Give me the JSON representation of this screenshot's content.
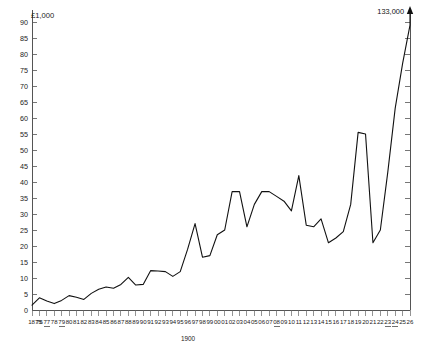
{
  "chart_data": {
    "type": "line",
    "title": "",
    "subtitle": "",
    "xlabel": "",
    "ylabel": "£1,000",
    "unit_label": "£1,000",
    "era_label": "1900",
    "ylim": [
      0,
      90
    ],
    "ytick_step": 5,
    "grid": false,
    "legend": null,
    "x": [
      1875,
      1876,
      1877,
      1878,
      1879,
      1880,
      1881,
      1882,
      1883,
      1884,
      1885,
      1886,
      1887,
      1888,
      1889,
      1890,
      1891,
      1892,
      1893,
      1894,
      1895,
      1896,
      1897,
      1898,
      1899,
      1900,
      1901,
      1902,
      1903,
      1904,
      1905,
      1906,
      1907,
      1908,
      1909,
      1910,
      1911,
      1912,
      1913,
      1914,
      1915,
      1916,
      1917,
      1918,
      1919,
      1920,
      1921,
      1922,
      1923,
      1924,
      1925,
      1926
    ],
    "xtick_labels": [
      "1875",
      "76",
      "77",
      "78",
      "79",
      "80",
      "81",
      "82",
      "83",
      "84",
      "85",
      "86",
      "87",
      "88",
      "89",
      "90",
      "91",
      "92",
      "93",
      "94",
      "95",
      "96",
      "97",
      "98",
      "99",
      "00",
      "01",
      "02",
      "03",
      "04",
      "05",
      "06",
      "07",
      "08",
      "09",
      "10",
      "11",
      "12",
      "13",
      "14",
      "15",
      "16",
      "17",
      "18",
      "19",
      "20",
      "21",
      "22",
      "23",
      "24",
      "25",
      "26"
    ],
    "ytick_labels": [
      "0",
      "5",
      "10",
      "15",
      "20",
      "25",
      "30",
      "35",
      "40",
      "45",
      "50",
      "55",
      "60",
      "65",
      "70",
      "75",
      "80",
      "85",
      "90"
    ],
    "ytick_values": [
      0,
      5,
      10,
      15,
      20,
      25,
      30,
      35,
      40,
      45,
      50,
      55,
      60,
      65,
      70,
      75,
      80,
      85,
      90
    ],
    "values": [
      1.5,
      3.8,
      2.8,
      2.0,
      3.0,
      4.5,
      4.0,
      3.3,
      5.2,
      6.5,
      7.2,
      6.8,
      8.0,
      10.2,
      7.8,
      8.0,
      12.3,
      12.2,
      12.0,
      10.5,
      12.0,
      19.0,
      27.0,
      16.5,
      17.0,
      23.5,
      25.0,
      37.0,
      37.0,
      26.0,
      33.0,
      37.0,
      37.0,
      35.5,
      34.0,
      31.0,
      42.0,
      26.5,
      26.0,
      28.5,
      21.0,
      22.5,
      24.5,
      33.0,
      55.5,
      55.0,
      21.0,
      25.0,
      43.0,
      63.0,
      77.0,
      89.0
    ],
    "annotations": [
      {
        "name": "final-peak",
        "text": "133,000",
        "x": 1926,
        "value": 133.0,
        "note": "value off scale, arrow points beyond top of chart"
      }
    ],
    "underlined_xticks": [
      "77",
      "79",
      "08",
      "23",
      "24"
    ],
    "colors": {
      "series": "#111111",
      "axis": "#555555",
      "text": "#222222",
      "background": "#ffffff"
    }
  }
}
